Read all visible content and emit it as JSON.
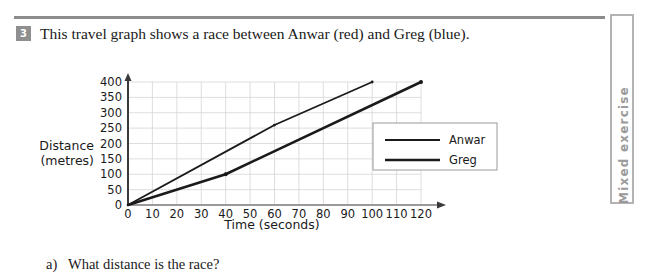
{
  "page": {
    "side_tab_label": "Mixed exercise",
    "rule_color": "#8c8c8c"
  },
  "question": {
    "number": "3",
    "stem": "This travel graph shows a race between Anwar (red) and Greg (blue).",
    "part_a_marker": "a)",
    "part_a_text": "What distance is the race?"
  },
  "chart_data": {
    "type": "line",
    "title": "",
    "xlabel": "Time (seconds)",
    "ylabel": "Distance (metres)",
    "ylabel_line1": "Distance",
    "ylabel_line2": "(metres)",
    "xlim": [
      0,
      120
    ],
    "ylim": [
      0,
      400
    ],
    "xticks": [
      0,
      10,
      20,
      30,
      40,
      50,
      60,
      70,
      80,
      90,
      100,
      110,
      120
    ],
    "yticks": [
      0,
      50,
      100,
      150,
      200,
      250,
      300,
      350,
      400
    ],
    "xtick_labels": [
      "0",
      "10",
      "20",
      "30",
      "40",
      "50",
      "60",
      "70",
      "80",
      "90",
      "100",
      "110",
      "120"
    ],
    "ytick_labels": [
      "0",
      "50",
      "100",
      "150",
      "200",
      "250",
      "300",
      "350",
      "400"
    ],
    "grid": true,
    "legend_position": "inside-right",
    "series": [
      {
        "name": "Anwar",
        "color": "#1a1a1a",
        "stroke_width": 1.8,
        "points": [
          [
            0,
            0
          ],
          [
            60,
            260
          ],
          [
            100,
            400
          ]
        ]
      },
      {
        "name": "Greg",
        "color": "#1a1a1a",
        "stroke_width": 2.6,
        "points": [
          [
            0,
            0
          ],
          [
            40,
            100
          ],
          [
            120,
            400
          ]
        ]
      }
    ],
    "legend": [
      {
        "label": "Anwar",
        "stroke_width": 1.8
      },
      {
        "label": "Greg",
        "stroke_width": 2.6
      }
    ]
  }
}
